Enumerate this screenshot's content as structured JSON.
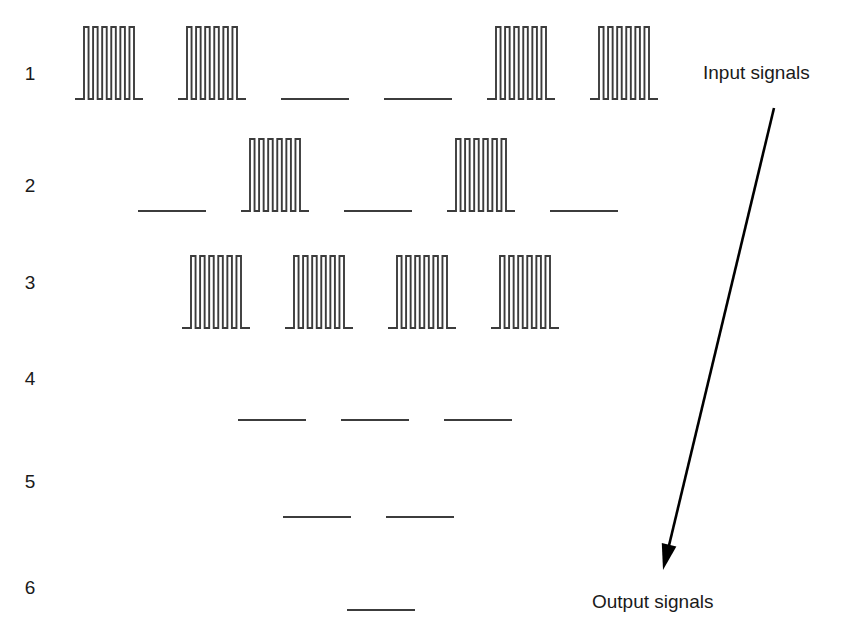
{
  "figure": {
    "background_color": "#ffffff",
    "trace_color": "#3c3c3c",
    "label_color": "#1a1a1a",
    "arrow_color": "#000000",
    "width": 850,
    "height": 641
  },
  "annotations": {
    "input_label": "Input signals",
    "output_label": "Output signals",
    "input_label_x": 703,
    "input_label_y": 79,
    "output_label_x": 592,
    "output_label_y": 608
  },
  "flow_arrow": {
    "name": "input-to-output-arrow",
    "x1": 774,
    "y1": 108,
    "x2": 666,
    "y2": 558,
    "head_tip_x": 663,
    "head_tip_y": 570,
    "head_width": 15,
    "head_length": 26
  },
  "chart_data": {
    "type": "line",
    "title": "",
    "subtitle": "",
    "xlabel": "",
    "ylabel": "",
    "grid": false,
    "legend": "none",
    "pulses_per_burst": 6,
    "segment_length": 68,
    "segment_pitch": 103,
    "burst_height": 72,
    "row_labels": [
      "1",
      "2",
      "3",
      "4",
      "5",
      "6"
    ],
    "rows": [
      {
        "label": "1",
        "label_x": 30,
        "label_y": 80,
        "baseline_y": 99,
        "start_x": 75,
        "segments": [
          "burst",
          "burst",
          "flat",
          "flat",
          "burst",
          "burst"
        ]
      },
      {
        "label": "2",
        "label_x": 30,
        "label_y": 192,
        "baseline_y": 211,
        "start_x": 138,
        "segments": [
          "flat",
          "burst",
          "flat",
          "burst",
          "flat"
        ]
      },
      {
        "label": "3",
        "label_x": 30,
        "label_y": 289,
        "baseline_y": 328,
        "start_x": 182,
        "segments": [
          "burst",
          "burst",
          "burst",
          "burst"
        ]
      },
      {
        "label": "4",
        "label_x": 30,
        "label_y": 385,
        "baseline_y": 420,
        "start_x": 238,
        "segments": [
          "flat",
          "flat",
          "flat"
        ]
      },
      {
        "label": "5",
        "label_x": 30,
        "label_y": 488,
        "baseline_y": 517,
        "start_x": 283,
        "segments": [
          "flat",
          "flat"
        ]
      },
      {
        "label": "6",
        "label_x": 30,
        "label_y": 594,
        "baseline_y": 610,
        "start_x": 347,
        "segments": [
          "flat"
        ]
      }
    ]
  }
}
